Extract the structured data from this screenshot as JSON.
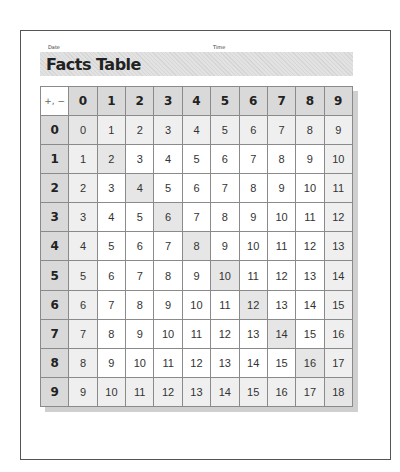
{
  "header": {
    "date_label": "Date",
    "time_label": "Time",
    "title": "Facts Table"
  },
  "table": {
    "corner_label": "+, −",
    "column_headers": [
      "0",
      "1",
      "2",
      "3",
      "4",
      "5",
      "6",
      "7",
      "8",
      "9"
    ],
    "row_headers": [
      "0",
      "1",
      "2",
      "3",
      "4",
      "5",
      "6",
      "7",
      "8",
      "9"
    ],
    "rows": [
      [
        "0",
        "1",
        "2",
        "3",
        "4",
        "5",
        "6",
        "7",
        "8",
        "9"
      ],
      [
        "1",
        "2",
        "3",
        "4",
        "5",
        "6",
        "7",
        "8",
        "9",
        "10"
      ],
      [
        "2",
        "3",
        "4",
        "5",
        "6",
        "7",
        "8",
        "9",
        "10",
        "11"
      ],
      [
        "3",
        "4",
        "5",
        "6",
        "7",
        "8",
        "9",
        "10",
        "11",
        "12"
      ],
      [
        "4",
        "5",
        "6",
        "7",
        "8",
        "9",
        "10",
        "11",
        "12",
        "13"
      ],
      [
        "5",
        "6",
        "7",
        "8",
        "9",
        "10",
        "11",
        "12",
        "13",
        "14"
      ],
      [
        "6",
        "7",
        "8",
        "9",
        "10",
        "11",
        "12",
        "13",
        "14",
        "15"
      ],
      [
        "7",
        "8",
        "9",
        "10",
        "11",
        "12",
        "13",
        "14",
        "15",
        "16"
      ],
      [
        "8",
        "9",
        "10",
        "11",
        "12",
        "13",
        "14",
        "15",
        "16",
        "17"
      ],
      [
        "9",
        "10",
        "11",
        "12",
        "13",
        "14",
        "15",
        "16",
        "17",
        "18"
      ]
    ],
    "shading": {
      "header": "#d9d9d9",
      "outer_ring": "#efefef",
      "diagonal": "#e6e6e6"
    }
  }
}
